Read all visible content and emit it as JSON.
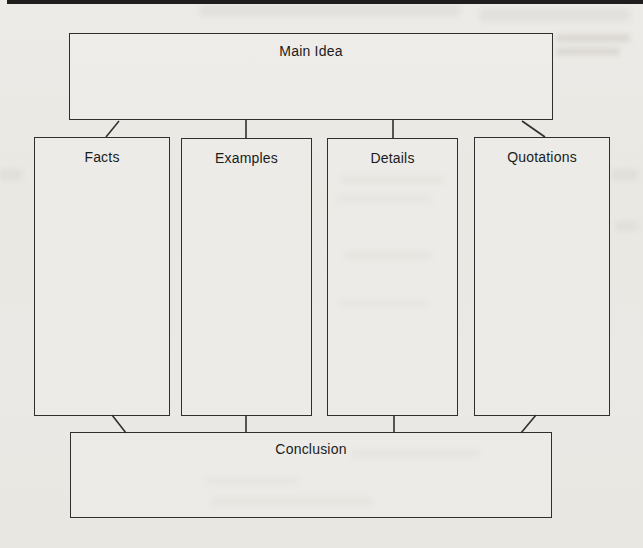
{
  "page": {
    "kind": "scanned-book-page-with-graphic-organizer"
  },
  "diagram": {
    "type": "graphic-organizer",
    "main_idea_label": "Main Idea",
    "columns": [
      {
        "label": "Facts"
      },
      {
        "label": "Examples"
      },
      {
        "label": "Details"
      },
      {
        "label": "Quotations"
      }
    ],
    "conclusion_label": "Conclusion"
  },
  "colors": {
    "paper": "#eae8e3",
    "box_border": "#2f2f2f",
    "label_text": "#1b1b1b",
    "top_rule": "#1e1e1e"
  }
}
